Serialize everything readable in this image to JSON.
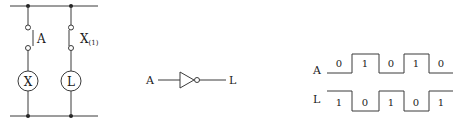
{
  "ladder": {
    "branches": [
      {
        "contact_label": "A",
        "coil_label": "X",
        "contact_type": "normally-open"
      },
      {
        "contact_label": "X",
        "contact_sub": "(1)",
        "coil_label": "L",
        "contact_type": "normally-closed"
      }
    ]
  },
  "gate": {
    "type": "NOT",
    "input_label": "A",
    "output_label": "L"
  },
  "timing": {
    "signals": [
      {
        "name": "A",
        "values": [
          "0",
          "1",
          "0",
          "1",
          "0"
        ]
      },
      {
        "name": "L",
        "values": [
          "1",
          "0",
          "1",
          "0",
          "1"
        ]
      }
    ]
  }
}
